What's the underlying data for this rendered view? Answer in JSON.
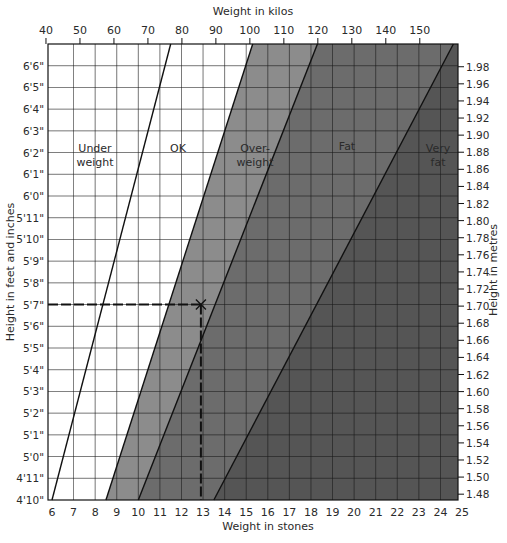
{
  "chart_data": {
    "type": "area",
    "title": "",
    "top_axis_label": "Weight in kilos",
    "xlabel": "Weight in stones",
    "ylabel_left": "Height in feet and inches",
    "ylabel_right": "Height in metres",
    "x_stones_ticks": [
      "6",
      "7",
      "8",
      "9",
      "10",
      "11",
      "12",
      "13",
      "14",
      "15",
      "16",
      "17",
      "18",
      "19",
      "20",
      "21",
      "22",
      "23",
      "24",
      "25"
    ],
    "x_kilos_ticks": [
      "40",
      "50",
      "60",
      "70",
      "80",
      "90",
      "100",
      "110",
      "120",
      "130",
      "140",
      "150"
    ],
    "y_feet_ticks": [
      "4'10\"",
      "4'11\"",
      "5'0\"",
      "5'1\"",
      "5'2\"",
      "5'3\"",
      "5'4\"",
      "5'5\"",
      "5'6\"",
      "5'7\"",
      "5'8\"",
      "5'9\"",
      "5'10\"",
      "5'11\"",
      "6'0\"",
      "6'1\"",
      "6'2\"",
      "6'3\"",
      "6'4\"",
      "6'5\"",
      "6'6\""
    ],
    "y_metres_ticks": [
      "1.48",
      "1.50",
      "1.52",
      "1.54",
      "1.56",
      "1.58",
      "1.60",
      "1.62",
      "1.64",
      "1.66",
      "1.68",
      "1.70",
      "1.72",
      "1.74",
      "1.76",
      "1.78",
      "1.80",
      "1.82",
      "1.84",
      "1.86",
      "1.88",
      "1.90",
      "1.92",
      "1.94",
      "1.96",
      "1.98"
    ],
    "xlim_stones": [
      6,
      25
    ],
    "ylim_height": [
      "4'10\"",
      "6'7\""
    ],
    "grid": true,
    "regions": [
      {
        "name": "Under weight",
        "label_lines": [
          "Under",
          "weight"
        ],
        "color": "#ffffff"
      },
      {
        "name": "OK",
        "label_lines": [
          "OK"
        ],
        "color": "#ffffff"
      },
      {
        "name": "Over-weight",
        "label_lines": [
          "Over-",
          "weight"
        ],
        "color": "#8c8c8c"
      },
      {
        "name": "Fat",
        "label_lines": [
          "Fat"
        ],
        "color": "#6c6c6c"
      },
      {
        "name": "Very fat",
        "label_lines": [
          "Very",
          "fat"
        ],
        "color": "#555555"
      }
    ],
    "boundaries_stones": [
      {
        "name": "underweight/ok",
        "at_4ft10": 6.0,
        "at_6ft7": 11.5
      },
      {
        "name": "ok/overweight",
        "at_4ft10": 8.5,
        "at_6ft7": 15.3
      },
      {
        "name": "overweight/fat",
        "at_4ft10": 10.0,
        "at_6ft7": 18.3
      },
      {
        "name": "fat/veryfat",
        "at_4ft10": 13.5,
        "at_6ft7": 24.6
      }
    ],
    "example_marker": {
      "height": "5'7\"",
      "weight_stones": 12.9,
      "marker": "x",
      "dashed_guides": true
    }
  }
}
